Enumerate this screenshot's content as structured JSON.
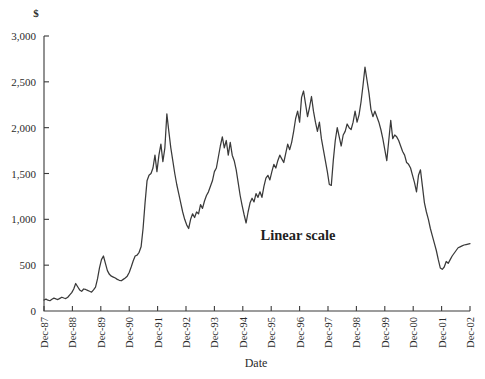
{
  "chart_data": {
    "type": "line",
    "title": "",
    "xlabel": "Date",
    "ylabel": "$",
    "ylim": [
      0,
      3000
    ],
    "grid": false,
    "legend": false,
    "annotations": [
      {
        "text": "Linear scale",
        "x": "Dec-94",
        "y": 900
      }
    ],
    "y_ticks": [
      0,
      500,
      1000,
      1500,
      2000,
      2500,
      3000
    ],
    "y_tick_labels": [
      "0",
      "500",
      "1,000",
      "1,500",
      "2,000",
      "2,500",
      "3,000"
    ],
    "x_tick_labels": [
      "Dec-87",
      "Dec-88",
      "Dec-89",
      "Dec-90",
      "Dec-91",
      "Dec-92",
      "Dec-93",
      "Dec-94",
      "Dec-95",
      "Dec-96",
      "Dec-97",
      "Dec-98",
      "Dec-99",
      "Dec-00",
      "Dec-01",
      "Dec-02"
    ],
    "x_tick_rotation": 90,
    "line_color": "#3a3a3a",
    "series": [
      {
        "name": "Index level",
        "values": [
          120,
          130,
          118,
          112,
          128,
          140,
          132,
          125,
          138,
          150,
          142,
          136,
          150,
          175,
          200,
          240,
          300,
          265,
          230,
          215,
          240,
          235,
          225,
          215,
          205,
          230,
          260,
          350,
          470,
          560,
          600,
          520,
          440,
          400,
          380,
          370,
          360,
          345,
          335,
          330,
          345,
          360,
          380,
          420,
          480,
          545,
          600,
          610,
          640,
          700,
          900,
          1180,
          1420,
          1480,
          1500,
          1560,
          1700,
          1520,
          1700,
          1820,
          1630,
          1780,
          2150,
          1960,
          1780,
          1640,
          1500,
          1380,
          1280,
          1180,
          1080,
          1000,
          940,
          900,
          1000,
          1060,
          1020,
          1080,
          1060,
          1160,
          1120,
          1200,
          1260,
          1300,
          1360,
          1420,
          1520,
          1560,
          1680,
          1800,
          1900,
          1780,
          1860,
          1700,
          1840,
          1700,
          1640,
          1540,
          1400,
          1260,
          1150,
          1050,
          960,
          1080,
          1180,
          1230,
          1190,
          1280,
          1240,
          1300,
          1240,
          1360,
          1450,
          1480,
          1430,
          1520,
          1600,
          1560,
          1640,
          1700,
          1660,
          1620,
          1720,
          1820,
          1760,
          1840,
          1960,
          2100,
          2180,
          2060,
          2330,
          2400,
          2260,
          2120,
          2220,
          2340,
          2180,
          2060,
          1960,
          2060,
          1880,
          1760,
          1640,
          1520,
          1380,
          1370,
          1640,
          1860,
          2000,
          1900,
          1800,
          1920,
          1960,
          2040,
          2000,
          1980,
          2060,
          2180,
          2060,
          2140,
          2280,
          2460,
          2660,
          2520,
          2380,
          2200,
          2120,
          2180,
          2120,
          2060,
          1980,
          1880,
          1760,
          1640,
          1860,
          2080,
          1880,
          1920,
          1900,
          1860,
          1800,
          1740,
          1700,
          1620,
          1600,
          1560,
          1480,
          1400,
          1300,
          1480,
          1540,
          1360,
          1180,
          1080,
          1000,
          900,
          820,
          740,
          660,
          560,
          470,
          455,
          480,
          540,
          520,
          560,
          600,
          630,
          660,
          690,
          700,
          710,
          720,
          725,
          730,
          735
        ]
      }
    ]
  },
  "axis": {
    "y_unit_label": "$",
    "x_title": "Date"
  }
}
